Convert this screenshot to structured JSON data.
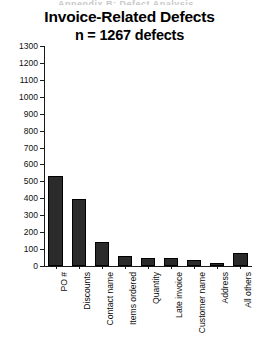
{
  "top_artifact": {
    "text": "Appendix B: Defect Analysis"
  },
  "chart_data": {
    "type": "bar",
    "title": "Invoice-Related Defects",
    "subtitle": "n = 1267 defects",
    "xlabel": "",
    "ylabel": "",
    "ylim": [
      0,
      1300
    ],
    "ytick_step": 100,
    "grid": false,
    "legend": "none",
    "bar_color": "#2b2b2b",
    "categories": [
      "PO #",
      "Discounts",
      "Contact name",
      "Items ordered",
      "Quantity",
      "Late invoice",
      "Customer name",
      "Address",
      "All others"
    ],
    "values": [
      530,
      395,
      140,
      62,
      50,
      45,
      35,
      15,
      75
    ],
    "ytick_labels": [
      "0",
      "100",
      "200",
      "300",
      "400",
      "500",
      "600",
      "700",
      "800",
      "900",
      "1000",
      "1100",
      "1200",
      "1300"
    ],
    "ytick_values": [
      0,
      100,
      200,
      300,
      400,
      500,
      600,
      700,
      800,
      900,
      1000,
      1100,
      1200,
      1300
    ]
  }
}
